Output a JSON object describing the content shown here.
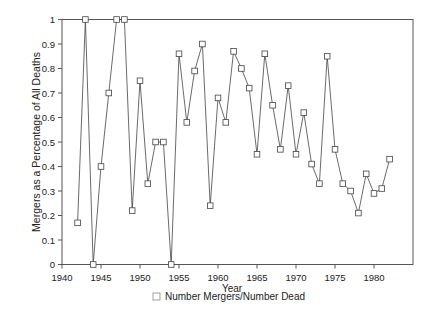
{
  "chart_data": {
    "type": "line",
    "title": "",
    "xlabel": "Year",
    "ylabel": "Mergers as a Percentage of All Deaths",
    "xlim": [
      1940,
      1985
    ],
    "ylim": [
      0,
      1
    ],
    "x_ticks": [
      "1940",
      "1945",
      "1950",
      "1955",
      "1960",
      "1965",
      "1970",
      "1975",
      "1980"
    ],
    "y_ticks": [
      "0",
      "0.1",
      "0.2",
      "0.3",
      "0.4",
      "0.5",
      "0.6",
      "0.7",
      "0.8",
      "0.9",
      "1"
    ],
    "grid": false,
    "legend_position": "bottom",
    "series": [
      {
        "name": "Number Mergers/Number Dead",
        "marker": "square",
        "x": [
          1942,
          1943,
          1944,
          1945,
          1946,
          1947,
          1948,
          1949,
          1950,
          1951,
          1952,
          1953,
          1954,
          1955,
          1956,
          1957,
          1958,
          1959,
          1960,
          1961,
          1962,
          1963,
          1964,
          1965,
          1966,
          1967,
          1968,
          1969,
          1970,
          1971,
          1972,
          1973,
          1974,
          1975,
          1976,
          1977,
          1978,
          1979,
          1980,
          1981,
          1982
        ],
        "values": [
          0.17,
          1.0,
          0.0,
          0.4,
          0.7,
          1.0,
          1.0,
          0.22,
          0.75,
          0.33,
          0.5,
          0.5,
          0.0,
          0.86,
          0.58,
          0.79,
          0.9,
          0.24,
          0.68,
          0.58,
          0.87,
          0.8,
          0.72,
          0.45,
          0.86,
          0.65,
          0.47,
          0.73,
          0.45,
          0.62,
          0.41,
          0.33,
          0.85,
          0.47,
          0.33,
          0.3,
          0.21,
          0.37,
          0.29,
          0.31,
          0.43
        ]
      }
    ]
  }
}
